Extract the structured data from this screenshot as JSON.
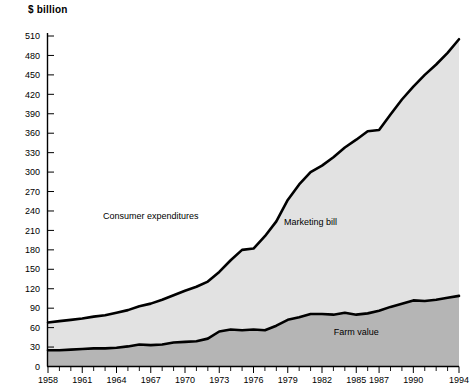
{
  "chart_data": {
    "type": "area",
    "title": "$ billion",
    "xlabel": "",
    "ylabel": "$ billion",
    "ylim": [
      0,
      510
    ],
    "xlim": [
      1958,
      1994
    ],
    "ytick_step": 30,
    "grid": false,
    "legend": "inline-annotations",
    "yticks": [
      0,
      30,
      60,
      90,
      120,
      150,
      180,
      210,
      240,
      270,
      300,
      330,
      360,
      390,
      420,
      450,
      480,
      510
    ],
    "ytick_labels": [
      "0",
      "30",
      "60",
      "90",
      "120",
      "150",
      "180",
      "210",
      "240",
      "270",
      "300",
      "330",
      "360",
      "390",
      "420",
      "450",
      "480",
      "510"
    ],
    "xticks": [
      1958,
      1961,
      1964,
      1967,
      1970,
      1973,
      1976,
      1979,
      1982,
      1985,
      1987,
      1990,
      1994
    ],
    "xtick_labels": [
      "1958",
      "1961",
      "1964",
      "1967",
      "1970",
      "1973",
      "1976",
      "1979",
      "1982",
      "1985",
      "1987",
      "1990",
      "1994"
    ],
    "x": [
      1958,
      1959,
      1960,
      1961,
      1962,
      1963,
      1964,
      1965,
      1966,
      1967,
      1968,
      1969,
      1970,
      1971,
      1972,
      1973,
      1974,
      1975,
      1976,
      1977,
      1978,
      1979,
      1980,
      1981,
      1982,
      1983,
      1984,
      1985,
      1986,
      1987,
      1988,
      1989,
      1990,
      1991,
      1992,
      1993,
      1994
    ],
    "series": [
      {
        "name": "Consumer expenditures",
        "role": "total-upper-boundary",
        "annotation": "Consumer expenditures",
        "values": [
          68,
          70,
          72,
          74,
          77,
          79,
          83,
          87,
          93,
          97,
          103,
          110,
          117,
          123,
          131,
          146,
          164,
          180,
          182,
          201,
          224,
          257,
          281,
          300,
          310,
          323,
          338,
          350,
          363,
          365,
          389,
          412,
          432,
          450,
          466,
          484,
          505
        ]
      },
      {
        "name": "Farm value",
        "role": "lower-band",
        "annotation": "Farm value",
        "fill": "#b5b5b5",
        "values": [
          25,
          25,
          26,
          27,
          28,
          28,
          29,
          31,
          34,
          33,
          34,
          37,
          38,
          39,
          43,
          54,
          57,
          56,
          57,
          56,
          63,
          72,
          76,
          81,
          81,
          80,
          83,
          80,
          82,
          86,
          92,
          97,
          102,
          101,
          103,
          106,
          109
        ]
      },
      {
        "name": "Marketing bill",
        "role": "upper-band",
        "annotation": "Marketing bill",
        "fill": "#e2e2e2",
        "description": "Area between Farm value and Consumer expenditures"
      }
    ],
    "annotations": [
      {
        "text": "Consumer expenditures",
        "x": 1967,
        "y": 228
      },
      {
        "text": "Marketing bill",
        "x": 1981,
        "y": 218
      },
      {
        "text": "Farm value",
        "x": 1985,
        "y": 48
      }
    ],
    "colors": {
      "line": "#000000",
      "marketing_bill_fill": "#e2e2e2",
      "farm_value_fill": "#b5b5b5",
      "background": "#ffffff",
      "axis": "#000000"
    }
  }
}
